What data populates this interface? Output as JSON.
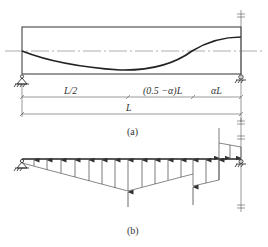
{
  "figure_a": {
    "caption": "(a)",
    "dimensions": {
      "segment_1": "L/2",
      "segment_2": "(0.5 −α)L",
      "segment_3": "αL",
      "total": "L"
    },
    "supports": [
      "pin-left",
      "roller-right"
    ],
    "tendon_profile": "parabolic-reverse-curve"
  },
  "figure_b": {
    "caption": "(b)",
    "description": "equivalent loads from prestressing tendon"
  },
  "colors": {
    "line": "#222222",
    "thin": "#555555",
    "text": "#333333"
  }
}
